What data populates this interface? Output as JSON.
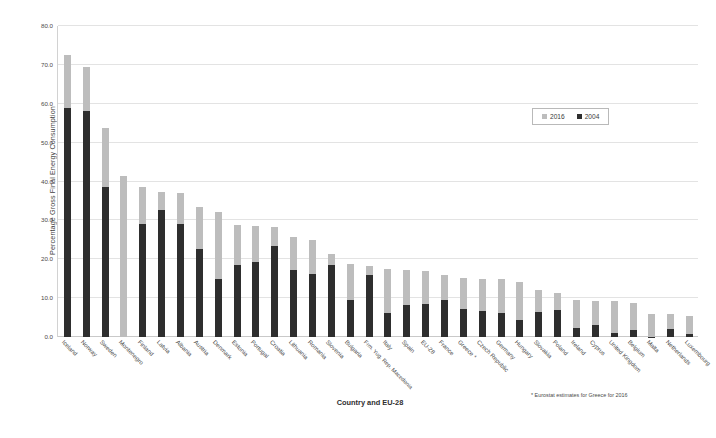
{
  "chart_data": {
    "type": "bar",
    "subtype": "stacked-overlay",
    "title": "",
    "xlabel": "Country and EU-28",
    "ylabel": "Percentage Gross Final Energy Consumption",
    "ylim": [
      0.0,
      80.0
    ],
    "ytick_labels": [
      "80.0",
      "70.0",
      "60.0",
      "50.0",
      "40.0",
      "30.0",
      "20.0",
      "10.0",
      "0.0"
    ],
    "ytick_values": [
      80.0,
      70.0,
      60.0,
      50.0,
      40.0,
      30.0,
      20.0,
      10.0,
      0.0
    ],
    "grid": true,
    "legend_position": "upper-right-inside",
    "categories": [
      "Iceland",
      "Norway",
      "Sweden",
      "Montenegro",
      "Finland",
      "Latvia",
      "Albania",
      "Austria",
      "Denmark",
      "Estonia",
      "Portugal",
      "Croatia",
      "Lithuania",
      "Romania",
      "Slovenia",
      "Bulgaria",
      "Frm. Yug. Rep. Macedonia",
      "Italy",
      "Spain",
      "EU-28",
      "France",
      "Greece *",
      "Czech Republic",
      "Germany",
      "Hungary",
      "Slovakia",
      "Poland",
      "Ireland",
      "Cyprus",
      "United Kingdom",
      "Belgium",
      "Malta",
      "Netherlands",
      "Luxembourg"
    ],
    "series": [
      {
        "name": "2016",
        "color": "#bdbdbd",
        "values": [
          72.6,
          69.4,
          53.8,
          41.5,
          38.7,
          37.2,
          37.1,
          33.5,
          32.2,
          28.8,
          28.5,
          28.3,
          25.6,
          25.0,
          21.3,
          18.8,
          18.2,
          17.4,
          17.3,
          17.0,
          15.9,
          15.2,
          14.9,
          14.8,
          14.2,
          12.0,
          11.3,
          9.5,
          9.3,
          9.3,
          8.7,
          6.0,
          6.0,
          5.4
        ]
      },
      {
        "name": "2004",
        "color": "#2e2e2e",
        "values": [
          58.9,
          58.1,
          38.7,
          0.0,
          29.2,
          32.8,
          29.1,
          22.6,
          14.8,
          18.4,
          19.2,
          23.5,
          17.2,
          16.3,
          18.4,
          9.6,
          16.0,
          6.3,
          8.3,
          8.5,
          9.5,
          7.1,
          6.8,
          6.2,
          4.4,
          6.4,
          6.9,
          2.4,
          3.1,
          1.1,
          1.9,
          0.1,
          2.0,
          0.9
        ]
      }
    ],
    "footnote": "* Eurostat estimates for Greece for 2016"
  },
  "legend": {
    "items": [
      {
        "label": "2016",
        "swatch_class": "s2016"
      },
      {
        "label": "2004",
        "swatch_class": "s2004"
      }
    ]
  }
}
